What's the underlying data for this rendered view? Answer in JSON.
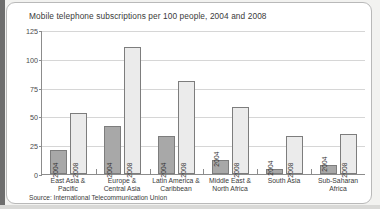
{
  "chart_data": {
    "type": "bar",
    "title": "Mobile telephone subscriptions per 100 people, 2004 and 2008",
    "source": "Source: International Telecommunication Union",
    "xlabel": "",
    "ylabel": "",
    "ylim": [
      0,
      125
    ],
    "yticks": [
      0,
      25,
      50,
      75,
      100,
      125
    ],
    "grid": true,
    "legend_position": "none",
    "categories": [
      "East Asia &\nPacific",
      "Europe &\nCentral Asia",
      "Latin America &\nCaribbean",
      "Middle East &\nNorth Africa",
      "South Asia",
      "Sub-Saharan\nAfrica"
    ],
    "category_lines": [
      [
        "East Asia &",
        "Pacific"
      ],
      [
        "Europe &",
        "Central Asia"
      ],
      [
        "Latin America &",
        "Caribbean"
      ],
      [
        "Middle East &",
        "North Africa"
      ],
      [
        "South Asia",
        ""
      ],
      [
        "Sub-Saharan",
        "Africa"
      ]
    ],
    "series": [
      {
        "name": "2004",
        "color": "#a8a8a8",
        "values": [
          21,
          42,
          33,
          12,
          4,
          8
        ]
      },
      {
        "name": "2008",
        "color": "#ebebeb",
        "values": [
          53,
          110,
          81,
          58,
          33,
          35
        ]
      }
    ]
  },
  "colors": {
    "bar_2004": "#a8a8a8",
    "bar_2008": "#ebebeb",
    "bar_border": "#7d7d7d",
    "grid": "#d6d6d6",
    "axis": "#8c8c8c",
    "panel_border": "#b9b9b9",
    "text": "#3a3a3a",
    "page_background": "#f2f2f0",
    "edge_strip": "#6e6e6e"
  }
}
